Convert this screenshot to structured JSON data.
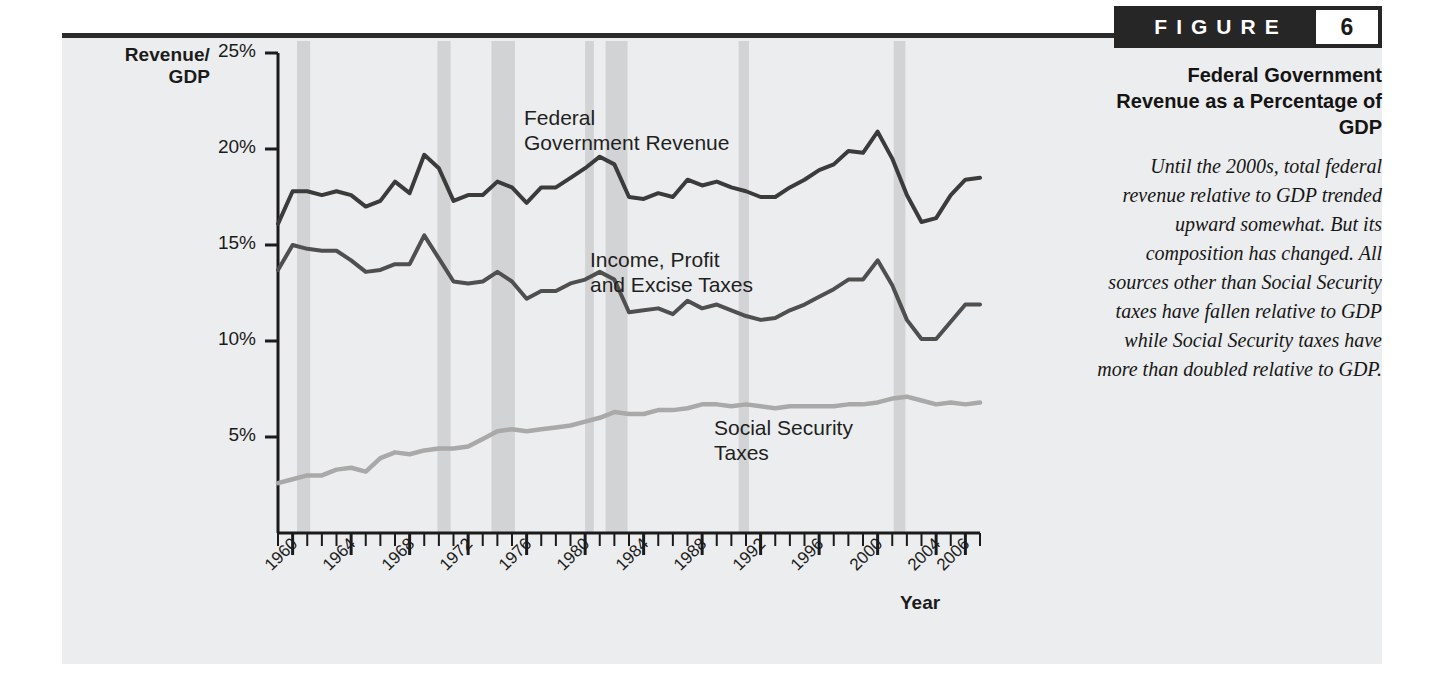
{
  "figure": {
    "badge_word": "FIGURE",
    "badge_number": "6",
    "title": "Federal Government Revenue as a Percentage of GDP",
    "caption": "Until the 2000s, total federal revenue relative to GDP trended upward somewhat. But its composition has changed. All sources other than Social Security taxes have fallen relative to GDP while Social Security taxes have more than doubled relative to GDP."
  },
  "axes": {
    "y_label_line1": "Revenue/",
    "y_label_line2": "GDP",
    "x_label": "Year",
    "y_ticks": [
      "25%",
      "20%",
      "15%",
      "10%",
      "5%"
    ],
    "y_tick_values": [
      25,
      20,
      15,
      10,
      5
    ],
    "x_ticks": [
      "1960",
      "1964",
      "1968",
      "1972",
      "1976",
      "1980",
      "1984",
      "1988",
      "1992",
      "1996",
      "2000",
      "2004",
      "2006"
    ],
    "x_tick_values": [
      1960,
      1964,
      1968,
      1972,
      1976,
      1980,
      1984,
      1988,
      1992,
      1996,
      2000,
      2004,
      2006
    ]
  },
  "series_labels": {
    "federal": "Federal\nGovernment Revenue",
    "income": "Income, Profit\nand Excise Taxes",
    "social": "Social Security\nTaxes"
  },
  "colors": {
    "panel_bg": "#ecedee",
    "top_rule": "#2b2b2b",
    "axis": "#1b1b1b",
    "recession_band": "#d2d3d4",
    "federal_line": "#3b3b3b",
    "income_line": "#4f4f4f",
    "social_line": "#a9a9a9",
    "badge_bg": "#262626",
    "badge_fg": "#ffffff"
  },
  "chart_data": {
    "type": "line",
    "title": "Federal Government Revenue as a Percentage of GDP",
    "xlabel": "Year",
    "ylabel": "Revenue/GDP",
    "xlim": [
      1959,
      2007
    ],
    "ylim": [
      0,
      25
    ],
    "grid": false,
    "legend": "inline-annotations",
    "x": [
      1959,
      1960,
      1961,
      1962,
      1963,
      1964,
      1965,
      1966,
      1967,
      1968,
      1969,
      1970,
      1971,
      1972,
      1973,
      1974,
      1975,
      1976,
      1977,
      1978,
      1979,
      1980,
      1981,
      1982,
      1983,
      1984,
      1985,
      1986,
      1987,
      1988,
      1989,
      1990,
      1991,
      1992,
      1993,
      1994,
      1995,
      1996,
      1997,
      1998,
      1999,
      2000,
      2001,
      2002,
      2003,
      2004,
      2005,
      2006,
      2007
    ],
    "series": [
      {
        "name": "Federal Government Revenue",
        "color": "#3b3b3b",
        "values": [
          16.1,
          17.8,
          17.8,
          17.6,
          17.8,
          17.6,
          17.0,
          17.3,
          18.3,
          17.7,
          19.7,
          19.0,
          17.3,
          17.6,
          17.6,
          18.3,
          18.0,
          17.2,
          18.0,
          18.0,
          18.5,
          19.0,
          19.6,
          19.2,
          17.5,
          17.4,
          17.7,
          17.5,
          18.4,
          18.1,
          18.3,
          18.0,
          17.8,
          17.5,
          17.5,
          18.0,
          18.4,
          18.9,
          19.2,
          19.9,
          19.8,
          20.9,
          19.5,
          17.6,
          16.2,
          16.4,
          17.6,
          18.4,
          18.5
        ]
      },
      {
        "name": "Income, Profit and Excise Taxes",
        "color": "#4f4f4f",
        "values": [
          13.7,
          15.0,
          14.8,
          14.7,
          14.7,
          14.2,
          13.6,
          13.7,
          14.0,
          14.0,
          15.5,
          14.3,
          13.1,
          13.0,
          13.1,
          13.6,
          13.1,
          12.2,
          12.6,
          12.6,
          13.0,
          13.2,
          13.6,
          13.2,
          11.5,
          11.6,
          11.7,
          11.4,
          12.1,
          11.7,
          11.9,
          11.6,
          11.3,
          11.1,
          11.2,
          11.6,
          11.9,
          12.3,
          12.7,
          13.2,
          13.2,
          14.2,
          12.9,
          11.1,
          10.1,
          10.1,
          11.0,
          11.9,
          11.9
        ]
      },
      {
        "name": "Social Security Taxes",
        "color": "#a9a9a9",
        "values": [
          2.6,
          2.8,
          3.0,
          3.0,
          3.3,
          3.4,
          3.2,
          3.9,
          4.2,
          4.1,
          4.3,
          4.4,
          4.4,
          4.5,
          4.9,
          5.3,
          5.4,
          5.3,
          5.4,
          5.5,
          5.6,
          5.8,
          6.0,
          6.3,
          6.2,
          6.2,
          6.4,
          6.4,
          6.5,
          6.7,
          6.7,
          6.6,
          6.7,
          6.6,
          6.5,
          6.6,
          6.6,
          6.6,
          6.6,
          6.7,
          6.7,
          6.8,
          7.0,
          7.1,
          6.9,
          6.7,
          6.8,
          6.7,
          6.8
        ]
      }
    ],
    "recession_bands": [
      {
        "start": 1960.3,
        "end": 1961.2
      },
      {
        "start": 1969.9,
        "end": 1970.8
      },
      {
        "start": 1973.6,
        "end": 1975.2
      },
      {
        "start": 1980.0,
        "end": 1980.6
      },
      {
        "start": 1981.4,
        "end": 1982.9
      },
      {
        "start": 1990.5,
        "end": 1991.2
      },
      {
        "start": 2001.1,
        "end": 2001.9
      }
    ]
  }
}
